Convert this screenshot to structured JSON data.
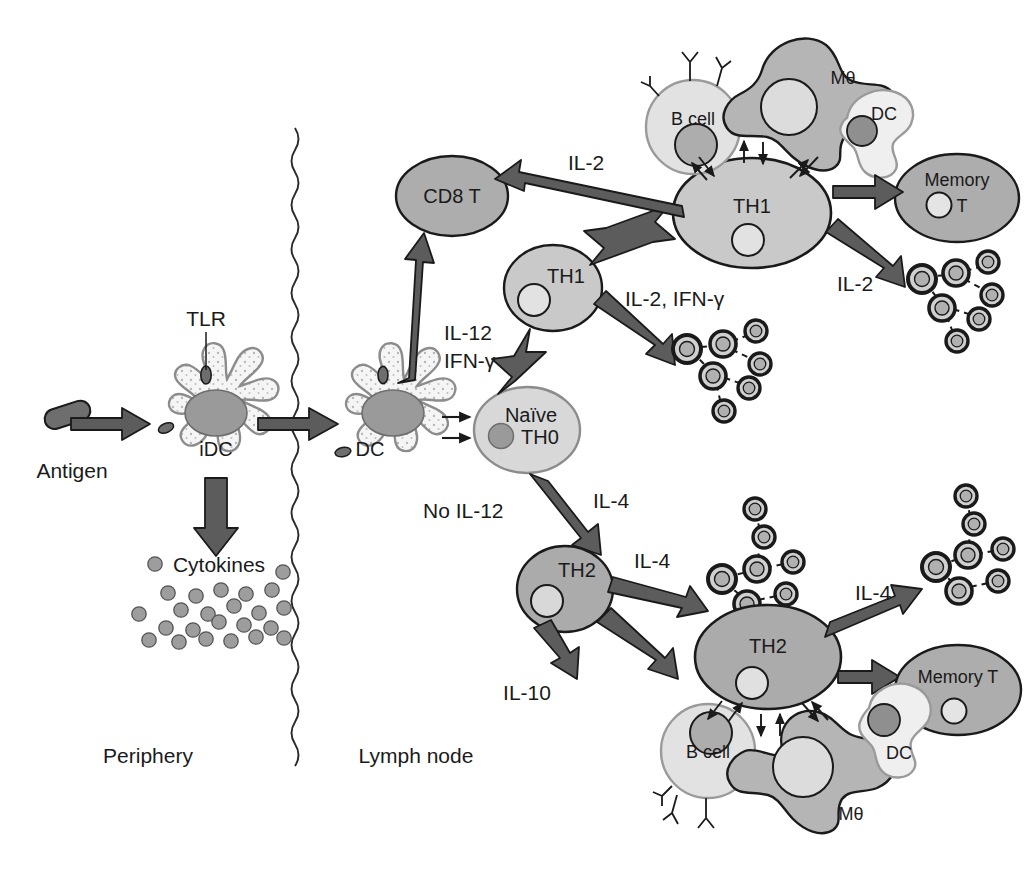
{
  "figure": {
    "compartments": [
      {
        "id": "periphery",
        "label": "Periphery"
      },
      {
        "id": "lymph_node",
        "label": "Lymph node"
      }
    ]
  },
  "colors": {
    "outline": "#1a1a1a",
    "arrow_fill": "#5c5c5c",
    "arrow_stroke": "#1a1a1a",
    "cell_dark": "#a8a8a8",
    "cell_mid": "#bdbdbd",
    "cell_light": "#dcdcdc",
    "cell_pale": "#efefef",
    "nucleus_dark": "#949494",
    "nucleus_light": "#e4e4e4",
    "dc_body": "#f4f4f4",
    "cytokine_dot": "#9d9d9d",
    "background": "#ffffff"
  },
  "cells": {
    "antigen": {
      "label": "Antigen",
      "shape": "rod"
    },
    "idc": {
      "label": "iDC",
      "shape": "dendritic",
      "receptor_label": "TLR"
    },
    "dc_lymph": {
      "label": "DC",
      "shape": "dendritic"
    },
    "naive": {
      "label_line1": "Naïve",
      "label_line2": "TH0",
      "shape": "oval"
    },
    "cd8t": {
      "label": "CD8 T",
      "shape": "oval"
    },
    "th1_small": {
      "label": "TH1",
      "shape": "oval"
    },
    "th1_large": {
      "label": "TH1",
      "shape": "oval"
    },
    "th2_small": {
      "label": "TH2",
      "shape": "oval"
    },
    "th2_large": {
      "label": "TH2",
      "shape": "oval"
    },
    "memory_t_top": {
      "label_line1": "Memory",
      "label_line2": "T",
      "shape": "oval"
    },
    "memory_t_bottom": {
      "label": "Memory T",
      "shape": "oval"
    },
    "bcell_top": {
      "label": "B cell",
      "shape": "round_with_antibodies"
    },
    "mphi_top": {
      "label": "Mθ",
      "shape": "amoeboid"
    },
    "dc_top": {
      "label": "DC",
      "shape": "blob"
    },
    "bcell_bottom": {
      "label": "B cell",
      "shape": "round_with_antibodies"
    },
    "mphi_bottom": {
      "label": "Mθ",
      "shape": "amoeboid"
    },
    "dc_bottom": {
      "label": "DC",
      "shape": "blob"
    }
  },
  "labels": {
    "tlr": "TLR",
    "antigen": "Antigen",
    "cytokines": "Cytokines",
    "periphery": "Periphery",
    "lymph_node": "Lymph node",
    "il12": "IL-12",
    "ifng": "IFN-γ",
    "no_il12": "No IL-12",
    "il4_branch": "IL-4",
    "il2_cd8": "IL-2",
    "il2_ifng": "IL-2, IFN-γ",
    "il2_expansion": "IL-2",
    "il4_expansion_upper": "IL-4",
    "il4_expansion_lower": "IL-4",
    "il10": "IL-10"
  },
  "arrows": [
    {
      "id": "antigen-to-idc",
      "label": ""
    },
    {
      "id": "idc-to-dc",
      "label": ""
    },
    {
      "id": "idc-to-cytokines",
      "label": ""
    },
    {
      "id": "dc-to-naive-a",
      "label": ""
    },
    {
      "id": "dc-to-naive-b",
      "label": ""
    },
    {
      "id": "dc-to-cd8t",
      "label": ""
    },
    {
      "id": "naive-to-th1",
      "label": "IL-12 / IFN-γ"
    },
    {
      "id": "naive-to-th2",
      "label": "IL-4"
    },
    {
      "id": "th1small-to-th1large",
      "label": ""
    },
    {
      "id": "th1small-to-clones",
      "label": "IL-2, IFN-γ"
    },
    {
      "id": "th1large-to-cd8t",
      "label": "IL-2"
    },
    {
      "id": "th1large-to-memory",
      "label": ""
    },
    {
      "id": "th1large-to-clones",
      "label": "IL-2"
    },
    {
      "id": "th2small-to-clones",
      "label": "IL-4"
    },
    {
      "id": "th2small-to-il10",
      "label": "IL-10"
    },
    {
      "id": "th2small-to-th2large",
      "label": ""
    },
    {
      "id": "th2large-to-clones",
      "label": "IL-4"
    },
    {
      "id": "th2large-to-memory",
      "label": ""
    }
  ],
  "clone_clusters": [
    {
      "id": "th1-small-clones",
      "count": 7
    },
    {
      "id": "th1-large-clones",
      "count": 7
    },
    {
      "id": "th2-small-clones",
      "count": 7
    },
    {
      "id": "th2-large-clones",
      "count": 7
    }
  ],
  "cytokine_dot_count": 24
}
